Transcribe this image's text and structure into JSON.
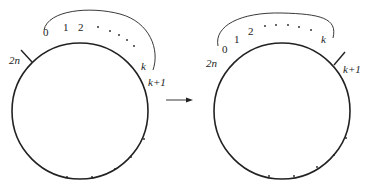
{
  "diagram": {
    "colors": {
      "stroke": "#222222",
      "background": "#ffffff"
    },
    "left": {
      "labels": {
        "zero": "0",
        "one": "1",
        "two": "2",
        "k": "k",
        "k_plus_1": "k+1",
        "two_n": "2n"
      },
      "marker_position": "2n"
    },
    "arrow": {
      "direction": "right"
    },
    "right": {
      "labels": {
        "zero": "0",
        "one": "1",
        "two": "2",
        "k": "k",
        "k_plus_1": "k+1",
        "two_n": "2n"
      },
      "marker_position": "k+1"
    }
  }
}
